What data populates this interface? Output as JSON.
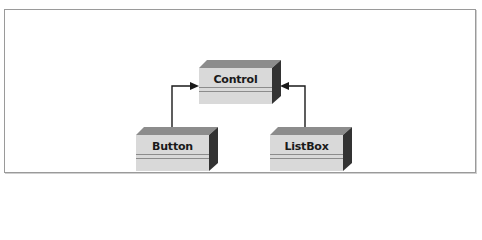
{
  "diagram": {
    "type": "class-inheritance",
    "nodes": [
      {
        "id": "control",
        "label": "Control"
      },
      {
        "id": "button",
        "label": "Button"
      },
      {
        "id": "listbox",
        "label": "ListBox"
      }
    ],
    "edges": [
      {
        "from": "button",
        "to": "control",
        "kind": "inherits"
      },
      {
        "from": "listbox",
        "to": "control",
        "kind": "inherits"
      }
    ],
    "colors": {
      "front": "#d9d9d9",
      "top": "#8c8c8c",
      "side": "#333333",
      "arrow": "#1a1a1a",
      "frame": "#9a9a9a"
    }
  }
}
